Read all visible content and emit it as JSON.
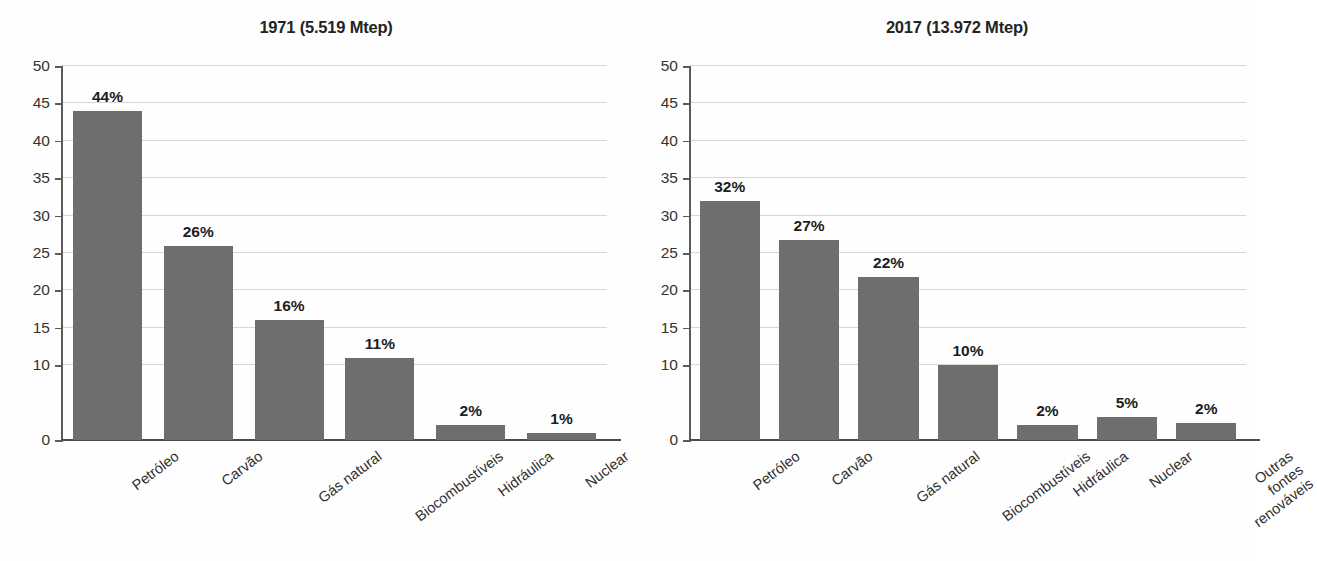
{
  "chart_data": [
    {
      "type": "bar",
      "title": "1971 (5.519 Mtep)",
      "categories": [
        "Petróleo",
        "Carvão",
        "Gás natural",
        "Biocombustíveis",
        "Hidráulica",
        "Nuclear"
      ],
      "values": [
        44,
        26,
        16,
        11,
        2,
        1
      ],
      "value_labels": [
        "44%",
        "26%",
        "16%",
        "11%",
        "2%",
        "1%"
      ],
      "xlabel": "",
      "ylabel": "",
      "ylim": [
        0,
        50
      ],
      "yticks": [
        0,
        10,
        15,
        20,
        25,
        30,
        35,
        40,
        45,
        50
      ],
      "ytick_labels": [
        "0",
        "10",
        "15",
        "20",
        "25",
        "30",
        "35",
        "40",
        "45",
        "50"
      ],
      "gridlines": [
        10,
        15,
        20,
        25,
        30,
        35,
        40,
        45,
        50
      ],
      "grid": true,
      "legend": "none",
      "bar_color": "#6e6e6e",
      "grid_color": "#d6d6d6",
      "axis_color": "#5b5b5b"
    },
    {
      "type": "bar",
      "title": "2017 (13.972 Mtep)",
      "categories": [
        "Petróleo",
        "Carvão",
        "Gás natural",
        "Biocombustíveis",
        "Hidráulica",
        "Nuclear",
        "Outras fontes\nrenováveis"
      ],
      "values": [
        32,
        26.8,
        21.8,
        10,
        2,
        3.1,
        2.3
      ],
      "value_labels": [
        "32%",
        "27%",
        "22%",
        "10%",
        "2%",
        "5%",
        "2%"
      ],
      "xlabel": "",
      "ylabel": "",
      "ylim": [
        0,
        50
      ],
      "yticks": [
        0,
        10,
        15,
        20,
        25,
        30,
        35,
        40,
        45,
        50
      ],
      "ytick_labels": [
        "0",
        "10",
        "15",
        "20",
        "25",
        "30",
        "35",
        "40",
        "45",
        "50"
      ],
      "gridlines": [
        10,
        15,
        20,
        25,
        30,
        35,
        40,
        45,
        50
      ],
      "grid": true,
      "legend": "none",
      "bar_color": "#6e6e6e",
      "grid_color": "#d6d6d6",
      "axis_color": "#5b5b5b"
    }
  ]
}
